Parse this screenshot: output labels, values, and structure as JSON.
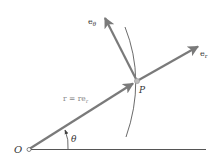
{
  "diagram": {
    "labels": {
      "origin": "O",
      "point": "P",
      "angle": "θ",
      "position_vector": "r = re",
      "position_vector_sub": "r",
      "e_r": "e",
      "e_r_sub": "r",
      "e_theta": "e",
      "e_theta_sub": "θ"
    },
    "colors": {
      "vector": "#7a7a7a",
      "axis": "#555555",
      "arc": "#444444",
      "label": "#333333",
      "vector_label": "#888888",
      "point_fill": "#bdbdbd"
    },
    "angle_deg": 32
  }
}
